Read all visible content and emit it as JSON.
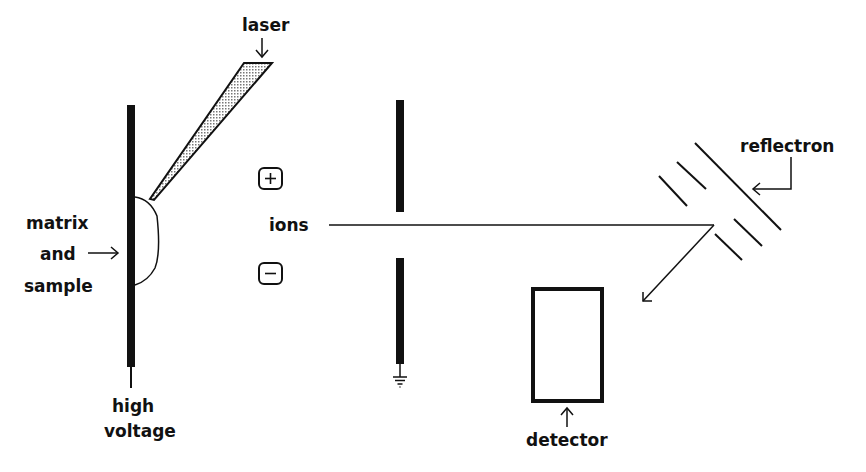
{
  "diagram": {
    "type": "MALDI-TOF mass spectrometer schematic",
    "labels": {
      "laser": "laser",
      "matrix_line1": "matrix",
      "matrix_line2": "and",
      "matrix_line3": "sample",
      "high_voltage_line1": "high",
      "high_voltage_line2": "voltage",
      "ions": "ions",
      "reflectron": "reflectron",
      "detector": "detector",
      "plus_symbol": "+",
      "minus_symbol": "−"
    },
    "colors": {
      "ink": "#111111",
      "laser_fill": "#bdbdbd",
      "background": "#ffffff"
    }
  }
}
